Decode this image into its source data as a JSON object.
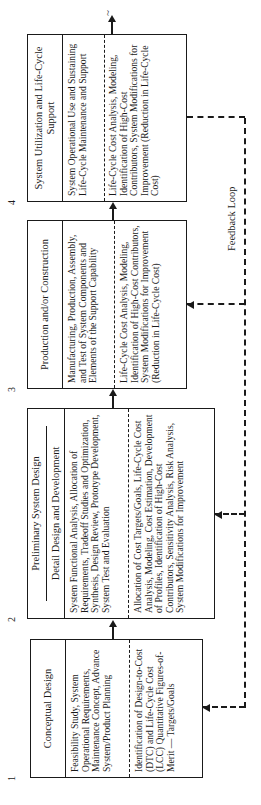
{
  "diagram": {
    "stages": [
      {
        "number": "1",
        "title": "Conceptual Design",
        "activities": "Feasibility Study, System Operational Requirements, Maintenance Concept, Advance System/Product Planning",
        "cost_activities": "Identification of Design-to-Cost (DTC) and Life-Cycle Cost (LCC) Quantitative Figures-of-Merit — Targets/Goals"
      },
      {
        "number": "2",
        "title": "Preliminary System Design",
        "subtitle": "Detail Design and Development",
        "activities": "System Functional Analysis, Allocation of Requirements, Tradeoff Studies and Optimization, Synthesis, Design Review, Prototype Development, System Test and Evaluation",
        "cost_activities": "Allocation of Cost Targets/Goals, Life-Cycle Cost Analysis, Modeling, Cost Estimation, Development of Profiles, Identification of High-Cost Contributors, Sensitivity Analysis, Risk Analysis, System Modifications for Improvement"
      },
      {
        "number": "3",
        "title": "Production and/or Construction",
        "activities": "Manufacturing, Production, Assembly, and Test of System Components and Elements of the Support Capability",
        "cost_activities": "Life-Cycle Cost Analysis, Modeling, Identification of High-Cost Contributors, System Modifications for Improvement (Reduction in Life-Cycle Cost)"
      },
      {
        "number": "4",
        "title": "System Utilization and Life-Cycle Support",
        "activities": "System Operational Use and Sustaining Life-Cycle Maintenance and Support",
        "cost_activities": "Life-Cycle Cost Analysis, Modeling, Identification of High-Cost Contributors, System Modifications for Improvement (Reduction in Life-Cycle Cost)"
      }
    ],
    "feedback_label": "Feedback Loop",
    "continuation_mark": "~"
  }
}
